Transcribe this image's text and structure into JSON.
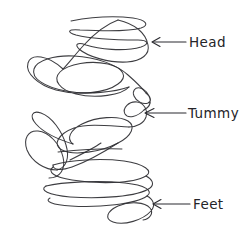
{
  "drawing": {
    "title": "Hand-drawn scribble figure with anatomy callouts",
    "background_color": "#ffffff",
    "ink_color": "#2e2e33",
    "media": "pen-on-paper scribble",
    "description": "A continuous looping scribble forming a rough figure, annotated with three arrows."
  },
  "annotations": [
    {
      "id": "head",
      "label": "Head",
      "icon": "left-arrow-icon",
      "arrow_direction": "left",
      "arrow_tip": {
        "x": 152,
        "y": 42
      },
      "arrow_tail": {
        "x": 186,
        "y": 42
      },
      "label_position": {
        "x": 189,
        "y": 47
      }
    },
    {
      "id": "tummy",
      "label": "Tummy",
      "icon": "left-arrow-icon",
      "arrow_direction": "left",
      "arrow_tip": {
        "x": 145,
        "y": 113
      },
      "arrow_tail": {
        "x": 186,
        "y": 113
      },
      "label_position": {
        "x": 188,
        "y": 118
      }
    },
    {
      "id": "feet",
      "label": "Feet",
      "icon": "left-arrow-icon",
      "arrow_direction": "left",
      "arrow_tip": {
        "x": 153,
        "y": 204
      },
      "arrow_tail": {
        "x": 190,
        "y": 204
      },
      "label_position": {
        "x": 193,
        "y": 209
      }
    }
  ]
}
